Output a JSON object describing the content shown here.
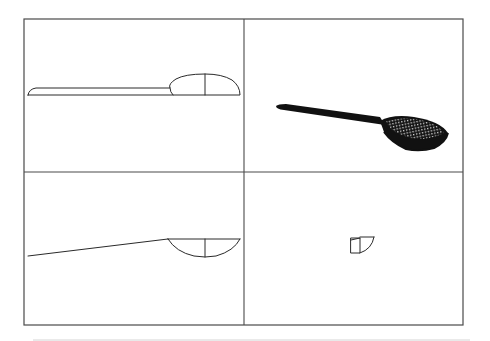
{
  "drawing": {
    "type": "multi-view CAD drawing",
    "subject": "slotted spoon / strainer ladle",
    "layout": "2x2 viewports",
    "frame": {
      "x": 24,
      "y": 19,
      "width": 439,
      "height": 306
    },
    "dividers": {
      "vertical_x": 244,
      "horizontal_y": 172
    },
    "colors": {
      "background": "#ffffff",
      "frame_stroke": "#4a4a4a",
      "line_stroke": "#2a2a2a",
      "solid_fill": "#111111",
      "bottom_rule": "#d4d4d4"
    },
    "viewports": [
      {
        "position": "top-left",
        "view": "front-elevation",
        "content": "spoon profile: flat handle with domed bowl, center line"
      },
      {
        "position": "top-right",
        "view": "isometric-shaded",
        "content": "3D rendered spoon with perforated mesh bowl"
      },
      {
        "position": "bottom-left",
        "view": "top-plan",
        "content": "spoon outline: tapered handle line and semicircular bowl with center line"
      },
      {
        "position": "bottom-right",
        "view": "side-elevation",
        "content": "end view: rectangle with quarter-circle bowl section"
      }
    ]
  }
}
